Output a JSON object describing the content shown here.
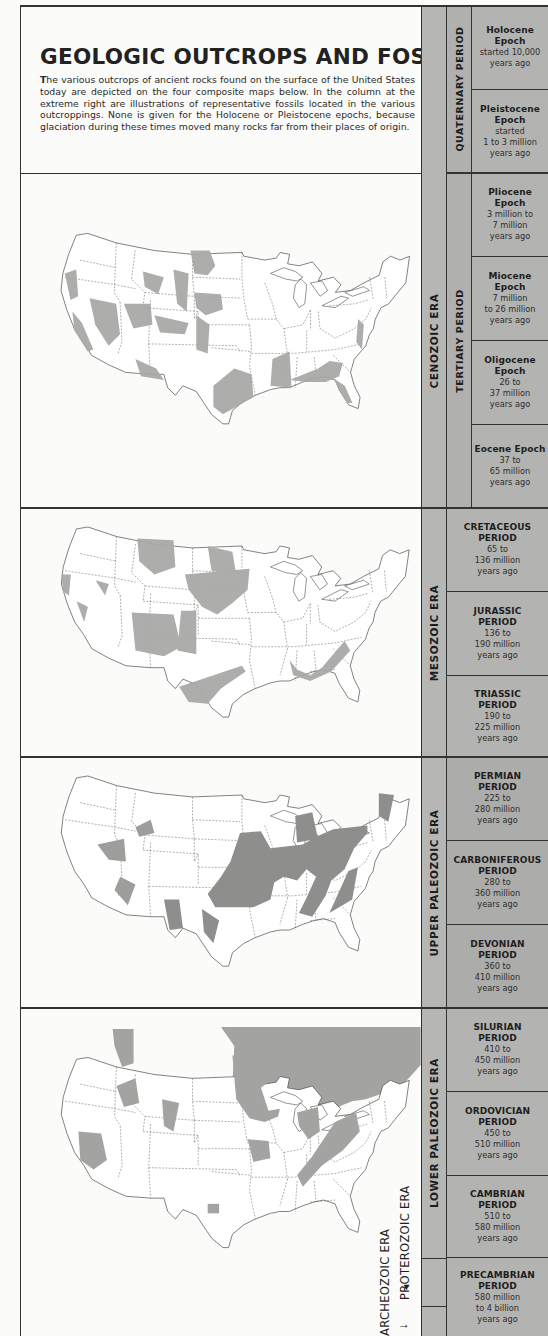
{
  "header": {
    "title": "GEOLOGIC OUTCROPS AND FOSSILS",
    "description": "The various outcrops of ancient rocks found on the surface of the United States today are depicted on the four composite maps below. In the column at the extreme right are illustrations of representative fossils located in the various outcroppings. None is given for the Holocene or Pleistocene epochs, because glaciation during these times moved many rocks far from their places of origin."
  },
  "colors": {
    "background": "#fbfbf9",
    "outcrop_shade": "#a9a9a7",
    "outcrop_dark": "#8e8e8c",
    "column_fill": "#b3b3b1",
    "border": "#333333"
  },
  "maps": [
    {
      "id": "cenozoic",
      "label": "Cenozoic outcrops map",
      "shading": "light"
    },
    {
      "id": "mesozoic",
      "label": "Mesozoic outcrops map",
      "shading": "light"
    },
    {
      "id": "upper-paleozoic",
      "label": "Upper Paleozoic outcrops map",
      "shading": "dark"
    },
    {
      "id": "lower-paleozoic",
      "label": "Lower Paleozoic outcrops map",
      "shading": "medium"
    }
  ],
  "timescale": {
    "eras": [
      {
        "label": "CENOZOIC ERA"
      },
      {
        "label": "MESOZOIC ERA"
      },
      {
        "label": "UPPER PALEOZOIC ERA"
      },
      {
        "label": "LOWER PALEOZOIC ERA"
      }
    ],
    "cenozoic_periods": [
      {
        "label": "QUATERNARY PERIOD"
      },
      {
        "label": "TERTIARY PERIOD"
      }
    ],
    "units": [
      {
        "name": "Holocene Epoch",
        "dates": [
          "started 10,000",
          "years ago"
        ]
      },
      {
        "name": "Pleistocene Epoch",
        "dates": [
          "started",
          "1 to 3 million",
          "years ago"
        ]
      },
      {
        "name": "Pliocene Epoch",
        "dates": [
          "3 million to",
          "7 million",
          "years ago"
        ]
      },
      {
        "name": "Miocene Epoch",
        "dates": [
          "7 million",
          "to 26 million",
          "years ago"
        ]
      },
      {
        "name": "Oligocene Epoch",
        "dates": [
          "26 to",
          "37 million",
          "years ago"
        ]
      },
      {
        "name": "Eocene Epoch",
        "dates": [
          "37 to",
          "65 million",
          "years ago"
        ]
      },
      {
        "name": "CRETACEOUS PERIOD",
        "dates": [
          "65 to",
          "136 million",
          "years ago"
        ]
      },
      {
        "name": "JURASSIC PERIOD",
        "dates": [
          "136 to",
          "190 million",
          "years ago"
        ]
      },
      {
        "name": "TRIASSIC PERIOD",
        "dates": [
          "190 to",
          "225 million",
          "years ago"
        ]
      },
      {
        "name": "PERMIAN PERIOD",
        "dates": [
          "225 to",
          "280 million",
          "years ago"
        ]
      },
      {
        "name": "CARBONIFEROUS PERIOD",
        "dates": [
          "280 to",
          "360 million",
          "years ago"
        ]
      },
      {
        "name": "DEVONIAN PERIOD",
        "dates": [
          "360 to",
          "410 million",
          "years ago"
        ]
      },
      {
        "name": "SILURIAN PERIOD",
        "dates": [
          "410 to",
          "450 million",
          "years ago"
        ]
      },
      {
        "name": "ORDOVICIAN PERIOD",
        "dates": [
          "450 to",
          "510 million",
          "years ago"
        ]
      },
      {
        "name": "CAMBRIAN PERIOD",
        "dates": [
          "510 to",
          "580 million",
          "years ago"
        ]
      },
      {
        "name": "PRECAMBRIAN PERIOD",
        "dates": [
          "580 million",
          "to 4 billion",
          "years ago"
        ]
      }
    ],
    "precambrian_eras": [
      {
        "label": "ARCHEOZOIC ERA",
        "pointer": "→"
      },
      {
        "label": "PROTEROZOIC ERA",
        "pointer": "▼"
      }
    ]
  }
}
